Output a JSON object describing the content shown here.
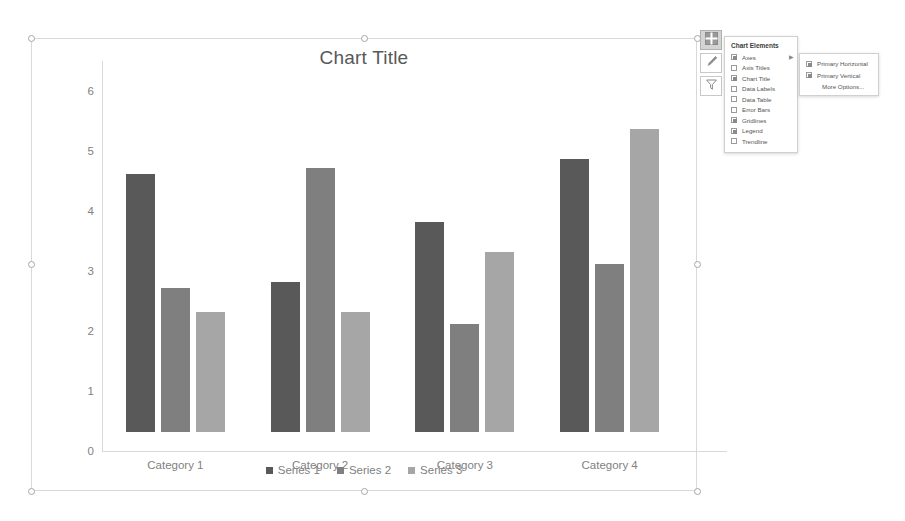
{
  "chart_data": {
    "type": "bar",
    "title": "Chart Title",
    "xlabel": "",
    "ylabel": "",
    "ylim": [
      0,
      6.5
    ],
    "yticks": [
      0,
      1,
      2,
      3,
      4,
      5,
      6
    ],
    "grid": false,
    "legend_position": "bottom",
    "categories": [
      "Category 1",
      "Category 2",
      "Category 3",
      "Category 4"
    ],
    "series": [
      {
        "name": "Series 1",
        "color": "#595959",
        "values": [
          4.3,
          2.5,
          3.5,
          4.55
        ]
      },
      {
        "name": "Series 2",
        "color": "#7f7f7f",
        "values": [
          2.4,
          4.4,
          1.8,
          2.8
        ]
      },
      {
        "name": "Series 3",
        "color": "#a6a6a6",
        "values": [
          2.0,
          2.0,
          3.0,
          5.05
        ]
      }
    ]
  },
  "side_buttons": [
    {
      "name": "chart-elements-button",
      "icon": "plus-grid-icon",
      "active": true
    },
    {
      "name": "chart-styles-button",
      "icon": "paintbrush-icon",
      "active": false
    },
    {
      "name": "chart-filters-button",
      "icon": "funnel-icon",
      "active": false
    }
  ],
  "chart_elements_panel": {
    "header": "Chart Elements",
    "items": [
      {
        "label": "Axes",
        "checked": true,
        "has_submenu": true
      },
      {
        "label": "Axis Titles",
        "checked": false,
        "has_submenu": false
      },
      {
        "label": "Chart Title",
        "checked": true,
        "has_submenu": false
      },
      {
        "label": "Data Labels",
        "checked": false,
        "has_submenu": false
      },
      {
        "label": "Data Table",
        "checked": false,
        "has_submenu": false
      },
      {
        "label": "Error Bars",
        "checked": false,
        "has_submenu": false
      },
      {
        "label": "Gridlines",
        "checked": true,
        "has_submenu": false
      },
      {
        "label": "Legend",
        "checked": true,
        "has_submenu": false
      },
      {
        "label": "Trendline",
        "checked": false,
        "has_submenu": false
      }
    ],
    "submenu": {
      "items": [
        {
          "label": "Primary Horizontal",
          "checked": true
        },
        {
          "label": "Primary Vertical",
          "checked": true
        }
      ],
      "more_options": "More Options..."
    }
  }
}
